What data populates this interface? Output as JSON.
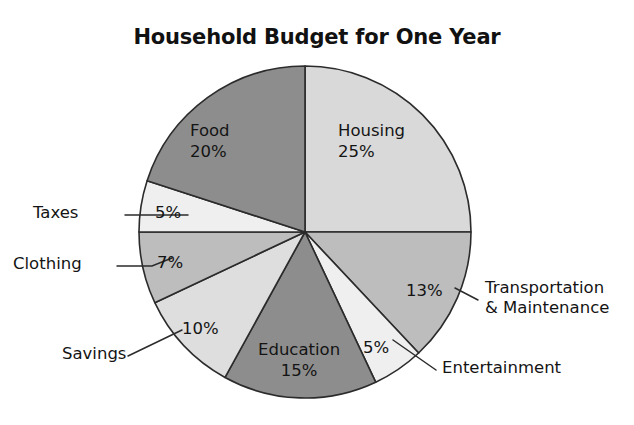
{
  "chart_data": {
    "type": "pie",
    "title": "Household Budget for One Year",
    "subtitle": "",
    "xlabel": "",
    "ylabel": "",
    "units": "percent",
    "total": 100,
    "legend_position": "none",
    "grid": false,
    "start_angle_deg": 0,
    "direction": "clockwise",
    "categories": [
      "Housing",
      "Transportation & Maintenance",
      "Entertainment",
      "Education",
      "Savings",
      "Clothing",
      "Taxes",
      "Food"
    ],
    "values": [
      25,
      13,
      5,
      15,
      10,
      7,
      5,
      20
    ],
    "slices": [
      {
        "name": "Housing",
        "value": 25,
        "percent_label": "25%",
        "color": "#d9d9d9",
        "label_placement": "inside",
        "label_lines": [
          "Housing",
          "25%"
        ],
        "start_deg": 0,
        "end_deg": 90
      },
      {
        "name": "Transportation & Maintenance",
        "value": 13,
        "percent_label": "13%",
        "color": "#bdbdbd",
        "label_placement": "outside",
        "label_lines": [
          "Transportation",
          "& Maintenance"
        ],
        "start_deg": 90,
        "end_deg": 136.8
      },
      {
        "name": "Entertainment",
        "value": 5,
        "percent_label": "5%",
        "color": "#efefef",
        "label_placement": "outside",
        "label_lines": [
          "Entertainment"
        ],
        "start_deg": 136.8,
        "end_deg": 154.8
      },
      {
        "name": "Education",
        "value": 15,
        "percent_label": "15%",
        "color": "#8d8d8d",
        "label_placement": "inside",
        "label_lines": [
          "Education",
          "15%"
        ],
        "start_deg": 154.8,
        "end_deg": 208.8
      },
      {
        "name": "Savings",
        "value": 10,
        "percent_label": "10%",
        "color": "#dedede",
        "label_placement": "outside",
        "label_lines": [
          "Savings"
        ],
        "start_deg": 208.8,
        "end_deg": 244.8
      },
      {
        "name": "Clothing",
        "value": 7,
        "percent_label": "7%",
        "color": "#bdbdbd",
        "label_placement": "outside",
        "label_lines": [
          "Clothing"
        ],
        "start_deg": 244.8,
        "end_deg": 270
      },
      {
        "name": "Taxes",
        "value": 5,
        "percent_label": "5%",
        "color": "#efefef",
        "label_placement": "outside",
        "label_lines": [
          "Taxes"
        ],
        "start_deg": 270,
        "end_deg": 288
      },
      {
        "name": "Food",
        "value": 20,
        "percent_label": "20%",
        "color": "#8d8d8d",
        "label_placement": "inside",
        "label_lines": [
          "Food",
          "20%"
        ],
        "start_deg": 288,
        "end_deg": 360
      }
    ]
  },
  "labels": {
    "housing_name": "Housing",
    "housing_pct": "25%",
    "food_name": "Food",
    "food_pct": "20%",
    "education_name": "Education",
    "education_pct": "15%",
    "transportation_pct": "13%",
    "transportation_line1": "Transportation",
    "transportation_line2": "& Maintenance",
    "entertainment_pct": "5%",
    "entertainment_name": "Entertainment",
    "savings_pct": "10%",
    "savings_name": "Savings",
    "clothing_pct": "7%",
    "clothing_name": "Clothing",
    "taxes_pct": "5%",
    "taxes_name": "Taxes"
  },
  "geometry": {
    "center_x": 305,
    "center_y": 232,
    "radius": 166
  },
  "colors": {
    "background": "#ffffff",
    "outline": "#2b2b2b",
    "text": "#141414",
    "dark_slice": "#8d8d8d",
    "medium_slice": "#bdbdbd",
    "light_slice": "#d9d9d9",
    "pale_slice": "#efefef"
  }
}
